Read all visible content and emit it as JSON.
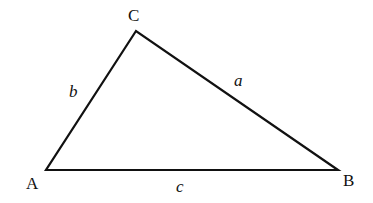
{
  "diagram": {
    "type": "triangle",
    "stroke_color": "#111111",
    "vertices": [
      {
        "id": "A",
        "label": "A",
        "x": 46,
        "y": 170,
        "label_x": 26,
        "label_y": 189
      },
      {
        "id": "B",
        "label": "B",
        "x": 338,
        "y": 170,
        "label_x": 343,
        "label_y": 186
      },
      {
        "id": "C",
        "label": "C",
        "x": 136,
        "y": 31,
        "label_x": 128,
        "label_y": 21
      }
    ],
    "sides": [
      {
        "id": "a",
        "label": "a",
        "from": "B",
        "to": "C",
        "label_x": 234,
        "label_y": 86
      },
      {
        "id": "b",
        "label": "b",
        "from": "C",
        "to": "A",
        "label_x": 69,
        "label_y": 97
      },
      {
        "id": "c",
        "label": "c",
        "from": "A",
        "to": "B",
        "label_x": 176,
        "label_y": 192
      }
    ]
  }
}
